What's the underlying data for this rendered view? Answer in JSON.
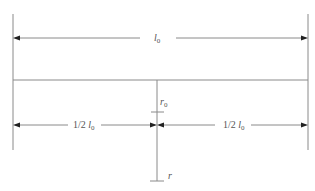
{
  "diagram": {
    "type": "dimension-drawing",
    "labels": {
      "total_length": {
        "symbol": "l",
        "subscript": "0"
      },
      "half_left": {
        "prefix": "1/2 ",
        "symbol": "l",
        "subscript": "0"
      },
      "half_right": {
        "prefix": "1/2 ",
        "symbol": "l",
        "subscript": "0"
      },
      "r0": {
        "symbol": "r",
        "subscript": "0"
      },
      "r": {
        "symbol": "r"
      }
    },
    "colors": {
      "line": "#8a8a8a",
      "arrowhead": "#222222",
      "text": "#555555",
      "background": "#ffffff"
    },
    "elements": [
      "left boundary line",
      "right boundary line",
      "top dimension arrow (total length l0)",
      "horizontal beam",
      "center vertical axis r",
      "r0 tick mark",
      "left half dimension arrow (1/2 l0)",
      "right half dimension arrow (1/2 l0)",
      "r tick mark"
    ]
  }
}
